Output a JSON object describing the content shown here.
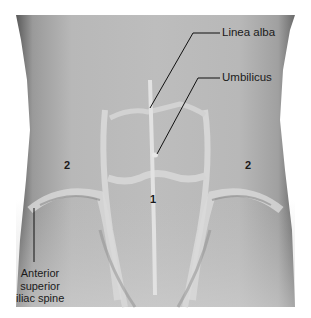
{
  "figure": {
    "labels": {
      "linea_alba": "Linea alba",
      "umbilicus": "Umbilicus",
      "asis_line1": "Anterior",
      "asis_line2": "superior",
      "asis_line3": "iliac spine"
    },
    "numbers": {
      "rectus": "1",
      "oblique_left": "2",
      "oblique_right": "2"
    },
    "colors": {
      "background": "#ffffff",
      "skin_mid": "#b4b4b4",
      "highlight": "#d8d8d8",
      "shadow": "#6e6e6e",
      "line": "#111111"
    }
  }
}
